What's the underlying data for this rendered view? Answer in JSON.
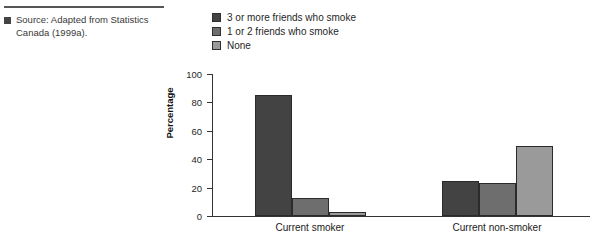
{
  "source": {
    "bullet_icon": "square-bullet-icon",
    "text": "Source: Adapted from Statistics Canada (1999a)."
  },
  "legend": {
    "position": "top",
    "items": [
      {
        "label": "3 or more friends who smoke",
        "color": "#434343"
      },
      {
        "label": "1 or 2 friends who smoke",
        "color": "#6e6e6e"
      },
      {
        "label": "None",
        "color": "#9a9a9a"
      }
    ]
  },
  "chart_data": {
    "type": "bar",
    "title": "",
    "xlabel": "",
    "ylabel": "Percentage",
    "ylim": [
      0,
      100
    ],
    "yticks": [
      0,
      20,
      40,
      60,
      80,
      100
    ],
    "ytick_labels": [
      "0",
      "20",
      "40",
      "60",
      "80",
      "100"
    ],
    "grid": false,
    "categories": [
      "Current smoker",
      "Current non-smoker"
    ],
    "series": [
      {
        "name": "3 or more friends who smoke",
        "color": "#434343",
        "values": [
          85,
          25
        ]
      },
      {
        "name": "1 or 2 friends who smoke",
        "color": "#6e6e6e",
        "values": [
          13,
          23
        ]
      },
      {
        "name": "None",
        "color": "#9a9a9a",
        "values": [
          3,
          49
        ]
      }
    ]
  }
}
